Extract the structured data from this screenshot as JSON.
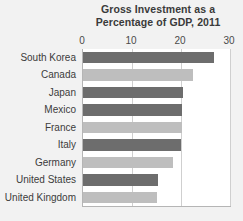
{
  "chart_data": {
    "type": "bar",
    "orientation": "horizontal",
    "title": "Gross Investment as a Percentage of GDP, 2011",
    "title_lines": [
      "Gross Investment as a",
      "Percentage of GDP, 2011"
    ],
    "xlabel": "",
    "ylabel": "",
    "xlim": [
      0,
      30
    ],
    "xticks": [
      0,
      10,
      20,
      30
    ],
    "xtick_labels": [
      "0",
      "10",
      "20",
      "30"
    ],
    "grid": true,
    "grid_axis": "x",
    "legend": false,
    "categories": [
      "South Korea",
      "Canada",
      "Japan",
      "Mexico",
      "France",
      "Italy",
      "Germany",
      "United States",
      "United Kingdom"
    ],
    "values": [
      26.7,
      22.4,
      20.5,
      20.3,
      20.3,
      20.0,
      18.4,
      15.3,
      15.0
    ],
    "bar_colors": [
      "#6d6d6d",
      "#bebebe",
      "#6d6d6d",
      "#6d6d6d",
      "#bebebe",
      "#6d6d6d",
      "#bebebe",
      "#6d6d6d",
      "#bebebe"
    ],
    "colors": {
      "dark_bar": "#6d6d6d",
      "light_bar": "#bebebe",
      "gridline": "#cfcfcf",
      "axis": "#b5b5b5",
      "plot_background": "#ffffff",
      "figure_background": "#f2f2f2",
      "text": "#3c3c3c"
    }
  }
}
